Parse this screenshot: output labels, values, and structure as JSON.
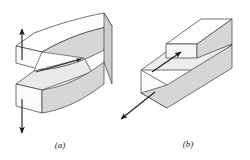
{
  "figure": {
    "background": "#ffffff",
    "stroke_color": "#3a3a3a",
    "top_face_color": "#fdfdfd",
    "side_face_color": "#d6d6d6",
    "front_face_color": "#e4e4e4",
    "end_face_color": "#fafafa",
    "arrow_color": "#1a1a1a"
  },
  "panels": [
    {
      "id": "a",
      "caption": "(a)",
      "name": "mode-i-opening",
      "description": "Split beam with two curved arms separating, crack wedge converging to a tip, vertical arrows pulling apart",
      "arrows": [
        {
          "name": "up-arrow",
          "direction": "up"
        },
        {
          "name": "down-arrow",
          "direction": "down"
        },
        {
          "name": "crack-tip-arrow",
          "direction": "up-right"
        }
      ]
    },
    {
      "id": "b",
      "caption": "(b)",
      "name": "mode-ii-sliding",
      "description": "Rectangular bar with offset upper block forming a notch, shear arrows in opposite directions",
      "arrows": [
        {
          "name": "notch-arrow",
          "direction": "up-right"
        },
        {
          "name": "front-arrow",
          "direction": "down-left"
        }
      ]
    }
  ]
}
